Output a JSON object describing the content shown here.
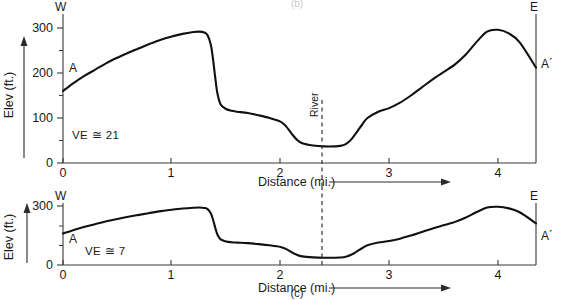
{
  "figure": {
    "panel_label_top_partial": "(b)",
    "panel_label_bottom": "(c)"
  },
  "panels": [
    {
      "id": "top",
      "ve_label": "VE ≅ 21",
      "left_axis_top_label": "W",
      "right_axis_top_label": "E",
      "left_profile_endpoint_label": "A",
      "right_profile_endpoint_label": "A´",
      "y_axis_title": "Elev (ft.)",
      "x_axis_title": "Distance (mi.)",
      "y_ticks": [
        "0",
        "100",
        "200",
        "300"
      ],
      "x_ticks": [
        "0",
        "1",
        "2",
        "3",
        "4"
      ],
      "river_label": "River"
    },
    {
      "id": "bottom",
      "ve_label": "VE ≅ 7",
      "left_axis_top_label": "W",
      "right_axis_top_label": "E",
      "left_profile_endpoint_label": "A",
      "right_profile_endpoint_label": "A´",
      "y_axis_title": "Elev (ft.)",
      "x_axis_title": "Distance (mi.)",
      "y_ticks": [
        "0",
        "300"
      ],
      "x_ticks": [
        "0",
        "1",
        "2",
        "3",
        "4"
      ],
      "river_label": ""
    }
  ],
  "chart_data": [
    {
      "type": "line",
      "id": "profile-ve-21",
      "title": "Topographic profile A–A´, VE ≅ 21",
      "xlabel": "Distance (mi.)",
      "ylabel": "Elev (ft.)",
      "xlim": [
        0,
        4.35
      ],
      "ylim": [
        0,
        320
      ],
      "xticks": [
        0,
        1,
        2,
        3,
        4
      ],
      "yticks": [
        0,
        100,
        200,
        300
      ],
      "grid": false,
      "legend": "none",
      "annotations": [
        {
          "text": "VE ≅ 21",
          "x": 0.35,
          "y": 55
        },
        {
          "text": "W",
          "x": 0.0,
          "y": 320
        },
        {
          "text": "E",
          "x": 4.35,
          "y": 320
        },
        {
          "text": "A",
          "x": 0.12,
          "y": 200
        },
        {
          "text": "A´",
          "x": 4.35,
          "y": 210
        },
        {
          "text": "River",
          "x": 2.38,
          "y": 110
        }
      ],
      "river_marker_x": 2.38,
      "series": [
        {
          "name": "Elevation profile (VE 21)",
          "x": [
            0.0,
            0.1,
            0.2,
            0.3,
            0.4,
            0.5,
            0.6,
            0.7,
            0.8,
            0.9,
            1.0,
            1.1,
            1.2,
            1.25,
            1.3,
            1.33,
            1.36,
            1.38,
            1.4,
            1.42,
            1.45,
            1.5,
            1.55,
            1.6,
            1.7,
            1.8,
            1.9,
            2.0,
            2.05,
            2.1,
            2.15,
            2.2,
            2.3,
            2.4,
            2.5,
            2.55,
            2.6,
            2.65,
            2.7,
            2.75,
            2.8,
            2.9,
            3.0,
            3.1,
            3.2,
            3.3,
            3.4,
            3.5,
            3.55,
            3.6,
            3.7,
            3.8,
            3.9,
            4.0,
            4.1,
            4.2,
            4.35
          ],
          "y": [
            160,
            178,
            194,
            208,
            222,
            234,
            245,
            255,
            265,
            274,
            281,
            287,
            291,
            292,
            290,
            284,
            262,
            230,
            190,
            155,
            130,
            120,
            116,
            114,
            111,
            106,
            100,
            92,
            82,
            66,
            52,
            44,
            39,
            37,
            37,
            38,
            42,
            52,
            68,
            85,
            100,
            114,
            122,
            134,
            150,
            168,
            186,
            202,
            210,
            218,
            240,
            268,
            292,
            296,
            288,
            268,
            212
          ]
        }
      ]
    },
    {
      "type": "line",
      "id": "profile-ve-7",
      "title": "Topographic profile A–A´, VE ≅ 7",
      "xlabel": "Distance (mi.)",
      "ylabel": "Elev (ft.)",
      "xlim": [
        0,
        4.35
      ],
      "ylim": [
        0,
        320
      ],
      "xticks": [
        0,
        1,
        2,
        3,
        4
      ],
      "yticks": [
        0,
        300
      ],
      "grid": false,
      "legend": "none",
      "annotations": [
        {
          "text": "VE ≅ 7",
          "x": 0.55,
          "y": 40
        },
        {
          "text": "W",
          "x": 0.0,
          "y": 320
        },
        {
          "text": "E",
          "x": 4.35,
          "y": 320
        },
        {
          "text": "A",
          "x": 0.12,
          "y": 135
        },
        {
          "text": "A´",
          "x": 4.35,
          "y": 185
        },
        {
          "text": "River",
          "x": 2.38,
          "y": 0
        }
      ],
      "river_marker_x": 2.38,
      "series": [
        {
          "name": "Elevation profile (VE 7)",
          "x": [
            0.0,
            0.1,
            0.2,
            0.3,
            0.4,
            0.5,
            0.6,
            0.7,
            0.8,
            0.9,
            1.0,
            1.1,
            1.2,
            1.25,
            1.3,
            1.33,
            1.36,
            1.38,
            1.4,
            1.42,
            1.45,
            1.5,
            1.55,
            1.6,
            1.7,
            1.8,
            1.9,
            2.0,
            2.05,
            2.1,
            2.15,
            2.2,
            2.3,
            2.4,
            2.5,
            2.55,
            2.6,
            2.65,
            2.7,
            2.75,
            2.8,
            2.9,
            3.0,
            3.1,
            3.2,
            3.3,
            3.4,
            3.5,
            3.55,
            3.6,
            3.7,
            3.8,
            3.9,
            4.0,
            4.1,
            4.2,
            4.35
          ],
          "y": [
            160,
            178,
            194,
            208,
            222,
            234,
            245,
            255,
            265,
            274,
            281,
            287,
            291,
            292,
            290,
            284,
            262,
            230,
            190,
            155,
            130,
            120,
            116,
            114,
            111,
            106,
            100,
            92,
            82,
            66,
            52,
            44,
            39,
            37,
            37,
            38,
            42,
            52,
            68,
            85,
            100,
            114,
            122,
            134,
            150,
            168,
            186,
            202,
            210,
            218,
            240,
            268,
            292,
            296,
            288,
            268,
            212
          ]
        }
      ]
    }
  ]
}
